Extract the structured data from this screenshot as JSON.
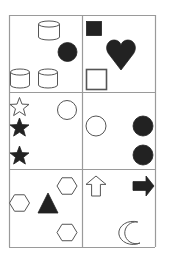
{
  "puzzle": {
    "grid": {
      "rows": 3,
      "cols": 2,
      "x_lines": [
        9,
        82,
        155
      ],
      "y_lines": [
        15,
        92,
        169,
        247
      ],
      "line_color": "#9a9a9a"
    },
    "colors": {
      "fill": "#222222",
      "stroke": "#555555",
      "background": "#ffffff"
    },
    "cells": [
      {
        "id": "cell-r1-c1",
        "shapes": [
          {
            "type": "cylinder",
            "style": "outline",
            "x": 38,
            "y": 21,
            "w": 21,
            "h": 19
          },
          {
            "type": "circle",
            "style": "filled",
            "cx": 67.5,
            "cy": 52,
            "r": 9.5
          },
          {
            "type": "cylinder",
            "style": "outline",
            "x": 10,
            "y": 69,
            "w": 19,
            "h": 19
          },
          {
            "type": "cylinder",
            "style": "outline",
            "x": 38,
            "y": 69,
            "w": 19,
            "h": 19
          }
        ]
      },
      {
        "id": "cell-r1-c2",
        "shapes": [
          {
            "type": "square",
            "style": "filled",
            "x": 86,
            "y": 21,
            "w": 15,
            "h": 14
          },
          {
            "type": "heart",
            "style": "filled",
            "x": 106,
            "y": 40,
            "w": 30,
            "h": 30
          },
          {
            "type": "square",
            "style": "outline",
            "x": 86,
            "y": 69,
            "w": 20,
            "h": 20
          }
        ]
      },
      {
        "id": "cell-r2-c1",
        "shapes": [
          {
            "type": "star",
            "style": "outline",
            "cx": 19.5,
            "cy": 107.5,
            "r": 10
          },
          {
            "type": "star",
            "style": "filled",
            "cx": 19.5,
            "cy": 128,
            "r": 10
          },
          {
            "type": "star",
            "style": "filled",
            "cx": 19.5,
            "cy": 156,
            "r": 10
          },
          {
            "type": "circle",
            "style": "outline",
            "cx": 67,
            "cy": 110,
            "r": 9.5
          }
        ]
      },
      {
        "id": "cell-r2-c2",
        "shapes": [
          {
            "type": "circle",
            "style": "outline",
            "cx": 96,
            "cy": 126,
            "r": 10
          },
          {
            "type": "circle",
            "style": "filled",
            "cx": 143,
            "cy": 126,
            "r": 10
          },
          {
            "type": "circle",
            "style": "filled",
            "cx": 143,
            "cy": 155,
            "r": 10
          }
        ]
      },
      {
        "id": "cell-r3-c1",
        "shapes": [
          {
            "type": "hexagon",
            "style": "outline",
            "cx": 19.5,
            "cy": 203,
            "r": 10
          },
          {
            "type": "triangle",
            "style": "filled",
            "x": 38,
            "y": 193,
            "w": 20,
            "h": 20
          },
          {
            "type": "hexagon",
            "style": "outline",
            "cx": 67,
            "cy": 186,
            "r": 10
          },
          {
            "type": "hexagon",
            "style": "outline",
            "cx": 67,
            "cy": 232.5,
            "r": 10
          }
        ]
      },
      {
        "id": "cell-r3-c2",
        "shapes": [
          {
            "type": "arrow-up",
            "style": "outline",
            "x": 86,
            "y": 176,
            "w": 20,
            "h": 20
          },
          {
            "type": "arrow-right",
            "style": "filled",
            "x": 133,
            "y": 176,
            "w": 21,
            "h": 20
          },
          {
            "type": "crescent",
            "style": "outline",
            "x": 125,
            "y": 222,
            "w": 15,
            "h": 21
          }
        ]
      }
    ]
  }
}
